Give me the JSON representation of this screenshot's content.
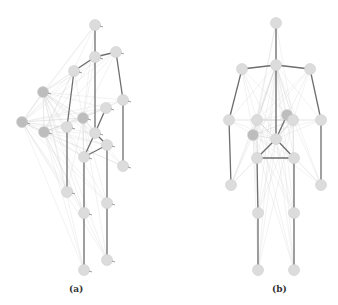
{
  "captions": {
    "a": "(a)",
    "b": "(b)"
  },
  "colors": {
    "node_fill": "#dcdcdc",
    "node_stroke": "#cfcfcf",
    "node_dark_fill": "#bdbdbd",
    "bone": "#6e6e6e",
    "faint_edge": "#cfcfcf",
    "background": "#ffffff"
  },
  "skeleton_a": {
    "nodes": [
      {
        "id": "head",
        "x": 95,
        "y": 25
      },
      {
        "id": "neck",
        "x": 95,
        "y": 57
      },
      {
        "id": "r_shoulder",
        "x": 116,
        "y": 52
      },
      {
        "id": "l_shoulder",
        "x": 74,
        "y": 71
      },
      {
        "id": "far_shoulder",
        "x": 43,
        "y": 92,
        "dark": true
      },
      {
        "id": "far_elbow",
        "x": 22,
        "y": 122,
        "dark": true
      },
      {
        "id": "far_hand",
        "x": 44,
        "y": 132,
        "dark": true
      },
      {
        "id": "l_elbow",
        "x": 67,
        "y": 127
      },
      {
        "id": "r_elbow",
        "x": 123,
        "y": 100
      },
      {
        "id": "chest_r",
        "x": 106,
        "y": 108
      },
      {
        "id": "chest_l",
        "x": 83,
        "y": 118,
        "dark": true
      },
      {
        "id": "spine",
        "x": 95,
        "y": 133
      },
      {
        "id": "hip_r",
        "x": 107,
        "y": 145
      },
      {
        "id": "hip_l",
        "x": 84,
        "y": 157
      },
      {
        "id": "r_hand",
        "x": 123,
        "y": 166
      },
      {
        "id": "l_hand",
        "x": 67,
        "y": 192
      },
      {
        "id": "l_knee",
        "x": 84,
        "y": 213
      },
      {
        "id": "r_knee",
        "x": 107,
        "y": 203
      },
      {
        "id": "l_foot",
        "x": 84,
        "y": 270
      },
      {
        "id": "r_foot",
        "x": 107,
        "y": 260
      }
    ],
    "bones": [
      [
        "head",
        "neck"
      ],
      [
        "neck",
        "r_shoulder"
      ],
      [
        "neck",
        "l_shoulder"
      ],
      [
        "neck",
        "spine"
      ],
      [
        "r_shoulder",
        "r_elbow"
      ],
      [
        "r_elbow",
        "r_hand"
      ],
      [
        "l_shoulder",
        "l_elbow"
      ],
      [
        "l_elbow",
        "l_hand"
      ],
      [
        "spine",
        "chest_r"
      ],
      [
        "spine",
        "hip_r"
      ],
      [
        "spine",
        "hip_l"
      ],
      [
        "hip_l",
        "hip_r"
      ],
      [
        "hip_l",
        "l_knee"
      ],
      [
        "l_knee",
        "l_foot"
      ],
      [
        "hip_r",
        "r_knee"
      ],
      [
        "r_knee",
        "r_foot"
      ]
    ],
    "hub_nodes": [
      "far_shoulder",
      "far_elbow",
      "far_hand",
      "chest_l"
    ]
  },
  "skeleton_b": {
    "nodes": [
      {
        "id": "head",
        "x": 276,
        "y": 23
      },
      {
        "id": "neck",
        "x": 276,
        "y": 65
      },
      {
        "id": "l_shoulder",
        "x": 242,
        "y": 69
      },
      {
        "id": "r_shoulder",
        "x": 310,
        "y": 69
      },
      {
        "id": "l_elbow",
        "x": 229,
        "y": 120
      },
      {
        "id": "r_elbow",
        "x": 321,
        "y": 120
      },
      {
        "id": "l_hand",
        "x": 231,
        "y": 185
      },
      {
        "id": "r_hand",
        "x": 321,
        "y": 185
      },
      {
        "id": "chest_l",
        "x": 257,
        "y": 120
      },
      {
        "id": "chest_r1",
        "x": 287,
        "y": 115,
        "dark": true
      },
      {
        "id": "chest_r2",
        "x": 293,
        "y": 120
      },
      {
        "id": "mid_l",
        "x": 253,
        "y": 135,
        "dark": true
      },
      {
        "id": "spine",
        "x": 276,
        "y": 139
      },
      {
        "id": "hip_l",
        "x": 257,
        "y": 158
      },
      {
        "id": "hip_r",
        "x": 294,
        "y": 158
      },
      {
        "id": "l_knee",
        "x": 258,
        "y": 213
      },
      {
        "id": "r_knee",
        "x": 294,
        "y": 213
      },
      {
        "id": "l_foot",
        "x": 258,
        "y": 270
      },
      {
        "id": "r_foot",
        "x": 294,
        "y": 270
      }
    ],
    "bones": [
      [
        "head",
        "neck"
      ],
      [
        "neck",
        "l_shoulder"
      ],
      [
        "neck",
        "r_shoulder"
      ],
      [
        "neck",
        "spine"
      ],
      [
        "l_shoulder",
        "l_elbow"
      ],
      [
        "l_elbow",
        "l_hand"
      ],
      [
        "r_shoulder",
        "r_elbow"
      ],
      [
        "r_elbow",
        "r_hand"
      ],
      [
        "spine",
        "chest_r1"
      ],
      [
        "spine",
        "hip_l"
      ],
      [
        "spine",
        "hip_r"
      ],
      [
        "hip_l",
        "hip_r"
      ],
      [
        "hip_l",
        "l_knee"
      ],
      [
        "l_knee",
        "l_foot"
      ],
      [
        "hip_r",
        "r_knee"
      ],
      [
        "r_knee",
        "r_foot"
      ]
    ],
    "hub_nodes": [
      "chest_l",
      "chest_r2",
      "mid_l",
      "spine",
      "neck"
    ]
  }
}
